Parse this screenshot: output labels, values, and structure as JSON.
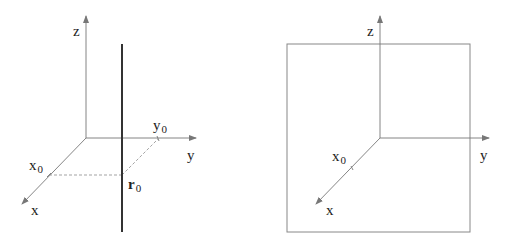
{
  "figures": [
    {
      "name": "line-figure",
      "axes": {
        "x_label": "x",
        "y_label": "y",
        "z_label": "z"
      },
      "marks": {
        "x0": "x",
        "x0_sub": "0",
        "y0": "y",
        "y0_sub": "0",
        "r0": "r",
        "r0_sub": "0"
      },
      "elements": [
        "vertical thick line through r0",
        "dashed projection lines from x0 and y0 to r0"
      ]
    },
    {
      "name": "plane-figure",
      "axes": {
        "x_label": "x",
        "y_label": "y",
        "z_label": "z"
      },
      "marks": {
        "x0": "x",
        "x0_sub": "0"
      },
      "elements": [
        "square plane perpendicular to x-axis at x0"
      ]
    }
  ],
  "colors": {
    "axis": "#777777",
    "thick_line": "#333333",
    "plane": "#888888",
    "dashed": "#999999",
    "text": "#222222"
  }
}
